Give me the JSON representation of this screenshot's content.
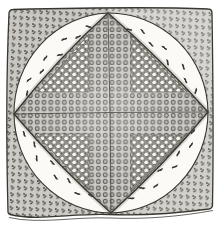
{
  "figure": {
    "type": "engraved-illustration",
    "subject": "Pieced quilt block: circle-and-diamond patchwork design",
    "alt": "Hand-engraved illustration of a square quilt block. Four stippled calico corner triangles surround a white curved band sprinkled with small leaf sprigs; inside is a large diamond pieced from dotted fabrics forming a central cross with four dark polka-dot patches."
  },
  "palette": {
    "paper": "#ffffff",
    "quilt_bg": "#fbfaf7",
    "outline": "#39372f",
    "seam": "#4a4840",
    "corner_dot": "#4d4a42",
    "corner_tl": "#c8c7c2",
    "corner_tr": "#d6d5d1",
    "corner_bl": "#cbcac5",
    "corner_br": "#d1d0cb",
    "sprig": "#38352d",
    "medium_bg": "#c5c4bf",
    "medium_ring": "#53504a",
    "medium_ring_fill": "#b4b3ae",
    "dark_bg": "#7e7c74",
    "dark_speckle": "#33312b",
    "dark_dot": "#f3f2ec",
    "shade": "#55534c",
    "highlight": "#ffffff"
  },
  "sprigs": {
    "per_quadrant": 9,
    "angles_deg": [
      13,
      22,
      31,
      40,
      49,
      58,
      67,
      76,
      84
    ],
    "radial_fractions": [
      0.32,
      0.66,
      0.38,
      0.62,
      0.3,
      0.68,
      0.4,
      0.6,
      0.35
    ],
    "tip_radius": 97,
    "outer_radius": 94,
    "center": {
      "x": 110,
      "y": 112.5
    }
  },
  "geometry": {
    "diamond": "M108,13 Q57,59 14,114 Q59,167 111,213 Q163,166 208,112 Q160,58 108,13 Z"
  }
}
